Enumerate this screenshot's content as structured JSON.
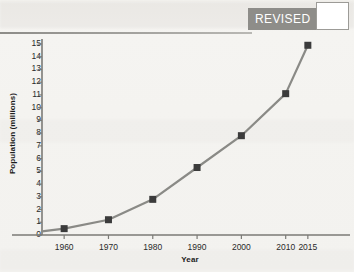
{
  "banner": {
    "revised_label": "REVISED",
    "revised_box_value": ""
  },
  "chart_data": {
    "type": "line",
    "title": "",
    "xlabel": "Year",
    "ylabel": "Population (millions)",
    "x": [
      1960,
      1970,
      1980,
      1990,
      2000,
      2010,
      2015
    ],
    "values": [
      0.5,
      1.2,
      2.8,
      5.3,
      7.8,
      11.1,
      14.9
    ],
    "xtick_labels": [
      "1960",
      "1970",
      "1980",
      "1990",
      "2000",
      "2010",
      "2015"
    ],
    "ytick_labels": [
      "0",
      "1",
      "2",
      "3",
      "4",
      "5",
      "6",
      "7",
      "8",
      "9",
      "10",
      "11",
      "12",
      "13",
      "14",
      "15"
    ],
    "ylim": [
      0,
      15
    ],
    "xlim": [
      1955,
      2020
    ],
    "grid": false,
    "legend": "none",
    "marker": "square",
    "line_color": "#8a8a86",
    "marker_color": "#3b3b3b",
    "axis_color": "#7b7a76"
  },
  "axis_titles": {
    "y": "Population (millions)",
    "x": "Year"
  }
}
